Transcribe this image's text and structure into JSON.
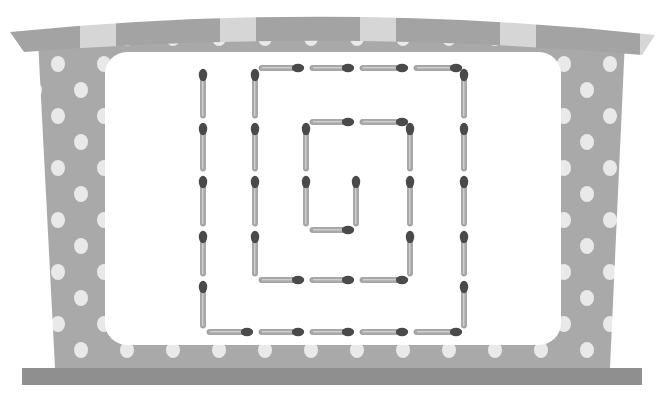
{
  "colors": {
    "frame": "#a9a9a9",
    "frame_dots": "#e9e9e9",
    "awning_dark": "#a3a3a3",
    "awning_light": "#d6d6d6",
    "base_bar": "#8f8f8f",
    "inner_panel": "#ffffff",
    "stick_body": "#a8a8a8",
    "stick_head": "#4a4a4a"
  },
  "puzzle": {
    "description": "Matchstick spiral puzzle inside a polka-dot frame",
    "grid": {
      "cols_x": [
        203,
        255,
        306,
        356,
        410,
        464
      ],
      "rows_y": [
        68,
        122,
        175,
        230,
        280,
        332
      ]
    },
    "stick_count": 35,
    "sticks": [
      {
        "o": "v",
        "c": 0,
        "r": 0
      },
      {
        "o": "v",
        "c": 0,
        "r": 1
      },
      {
        "o": "v",
        "c": 0,
        "r": 2
      },
      {
        "o": "v",
        "c": 0,
        "r": 3
      },
      {
        "o": "v",
        "c": 0,
        "r": 4
      },
      {
        "o": "h",
        "c": 0,
        "r": 5
      },
      {
        "o": "h",
        "c": 1,
        "r": 5
      },
      {
        "o": "h",
        "c": 2,
        "r": 5
      },
      {
        "o": "h",
        "c": 3,
        "r": 5
      },
      {
        "o": "h",
        "c": 4,
        "r": 5
      },
      {
        "o": "v",
        "c": 5,
        "r": 0
      },
      {
        "o": "v",
        "c": 5,
        "r": 1
      },
      {
        "o": "v",
        "c": 5,
        "r": 2
      },
      {
        "o": "v",
        "c": 5,
        "r": 3
      },
      {
        "o": "v",
        "c": 5,
        "r": 4
      },
      {
        "o": "h",
        "c": 1,
        "r": 0
      },
      {
        "o": "h",
        "c": 2,
        "r": 0
      },
      {
        "o": "h",
        "c": 3,
        "r": 0
      },
      {
        "o": "h",
        "c": 4,
        "r": 0
      },
      {
        "o": "v",
        "c": 1,
        "r": 0
      },
      {
        "o": "v",
        "c": 1,
        "r": 1
      },
      {
        "o": "v",
        "c": 1,
        "r": 2
      },
      {
        "o": "v",
        "c": 1,
        "r": 3
      },
      {
        "o": "h",
        "c": 1,
        "r": 4
      },
      {
        "o": "h",
        "c": 2,
        "r": 4
      },
      {
        "o": "h",
        "c": 3,
        "r": 4
      },
      {
        "o": "v",
        "c": 4,
        "r": 1
      },
      {
        "o": "v",
        "c": 4,
        "r": 2
      },
      {
        "o": "v",
        "c": 4,
        "r": 3
      },
      {
        "o": "h",
        "c": 2,
        "r": 1
      },
      {
        "o": "h",
        "c": 3,
        "r": 1
      },
      {
        "o": "v",
        "c": 2,
        "r": 1
      },
      {
        "o": "v",
        "c": 2,
        "r": 2
      },
      {
        "o": "h",
        "c": 2,
        "r": 3
      },
      {
        "o": "v",
        "c": 3,
        "r": 2
      }
    ]
  }
}
